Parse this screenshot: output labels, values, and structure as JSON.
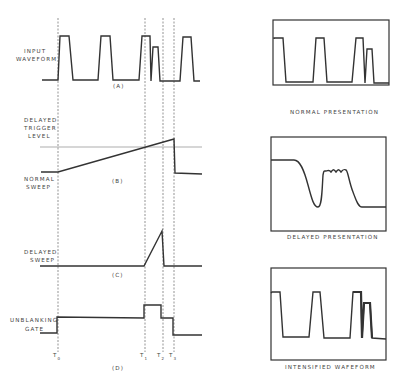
{
  "timing_diagram": {
    "panels": [
      {
        "id": "A",
        "label": "(A)",
        "signal": "INPUT WAVEFORM",
        "label_lines": [
          "INPUT",
          "WAVEFORM"
        ]
      },
      {
        "id": "B",
        "label": "(B)",
        "signal": "NORMAL SWEEP",
        "label_lines": [
          "NORMAL",
          "SWEEP"
        ],
        "reference": "DELAYED TRIGGER LEVEL",
        "reference_lines": [
          "DELAYED",
          "TRIGGER",
          "LEVEL"
        ]
      },
      {
        "id": "C",
        "label": "(C)",
        "signal": "DELAYED SWEEP",
        "label_lines": [
          "DELAYED",
          "SWEEP"
        ]
      },
      {
        "id": "D",
        "label": "(D)",
        "signal": "UNBLANKING GATE",
        "label_lines": [
          "UNBLANKING",
          "GATE"
        ]
      }
    ],
    "time_markers": [
      {
        "name": "T",
        "sub": "0"
      },
      {
        "name": "T",
        "sub": "1"
      },
      {
        "name": "T",
        "sub": "2"
      },
      {
        "name": "T",
        "sub": "3"
      }
    ]
  },
  "screens": [
    {
      "caption": "NORMAL PRESENTATION"
    },
    {
      "caption": "DELAYED PRESENTATION"
    },
    {
      "caption": "INTENSIFIED WAFEFORM"
    }
  ]
}
